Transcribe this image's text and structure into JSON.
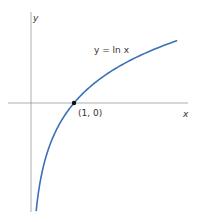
{
  "chart_data": {
    "type": "line",
    "title": "",
    "function": "ln x",
    "curve_label": "y = ln x",
    "xlabel": "x",
    "ylabel": "y",
    "annotations": [
      {
        "text": "(1, 0)",
        "x": 1,
        "y": 0,
        "marker": "dot"
      }
    ],
    "series": [
      {
        "name": "y = ln x",
        "x": [
          0.12,
          0.2,
          0.3,
          0.5,
          0.75,
          1,
          1.5,
          2,
          2.5,
          3,
          3.4
        ],
        "values": [
          -2.12,
          -1.61,
          -1.2,
          -0.69,
          -0.29,
          0,
          0.41,
          0.69,
          0.92,
          1.1,
          1.22
        ]
      }
    ],
    "xlim": [
      -0.5,
      3.6
    ],
    "ylim": [
      -2.2,
      2.0
    ],
    "grid": false,
    "legend": "none",
    "colors": {
      "curve": "#3b6fb6",
      "axes": "#9a9a9a",
      "point": "#111111"
    }
  },
  "labels": {
    "y_axis": "y",
    "x_axis": "x",
    "curve": "y = ln x",
    "point": "(1, 0)"
  }
}
